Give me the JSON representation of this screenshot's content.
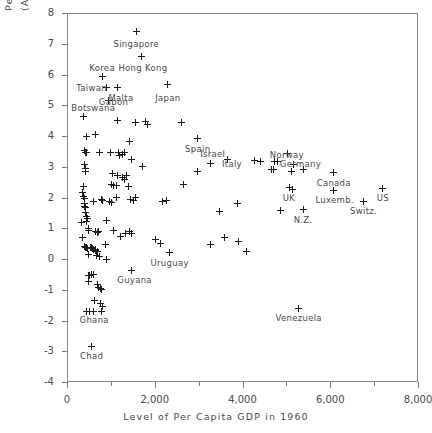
{
  "chart_data": {
    "type": "scatter",
    "title": "",
    "xlabel": "Level of Per Capita GDP in 1960",
    "ylabel_line1": "Percentage Growth Rate of Per Capita GDP",
    "ylabel_line2": "(Annual Rate, Compounded Continuously)",
    "xlim": [
      0,
      8000
    ],
    "ylim": [
      -4,
      8
    ],
    "xticks": [
      0,
      2000,
      4000,
      6000,
      8000
    ],
    "xtick_labels": [
      "0",
      "2,000",
      "4,000",
      "6,000",
      "8,000"
    ],
    "xminorticks": [
      1000,
      3000,
      5000,
      7000
    ],
    "yticks": [
      -4,
      -3,
      -2,
      -1,
      0,
      1,
      2,
      3,
      4,
      5,
      6,
      7,
      8
    ],
    "ytick_labels": [
      "-4",
      "-3",
      "-2",
      "-1",
      "0",
      "1",
      "2",
      "3",
      "4",
      "5",
      "6",
      "7",
      "8"
    ],
    "grid": false,
    "legend": false,
    "marker": "plus",
    "marker_color": "#1d1d1d",
    "frame_color": "#8a8a8a",
    "annotations": [
      {
        "label": "Singapore",
        "x": 1580,
        "y": 7.4,
        "lx": 1580,
        "ly": 7.0
      },
      {
        "label": "Hong Kong",
        "x": 1700,
        "y": 6.6,
        "lx": 1730,
        "ly": 6.22
      },
      {
        "label": "Korea",
        "x": 820,
        "y": 5.93,
        "lx": 800,
        "ly": 6.22
      },
      {
        "label": "Taiwan",
        "x": 900,
        "y": 5.58,
        "lx": 560,
        "ly": 5.55
      },
      {
        "label": "Malta",
        "x": 1140,
        "y": 5.58,
        "lx": 1230,
        "ly": 5.22
      },
      {
        "label": "Japan",
        "x": 2300,
        "y": 5.68,
        "lx": 2300,
        "ly": 5.25
      },
      {
        "label": "Gabon",
        "x": 950,
        "y": 5.14,
        "lx": 1060,
        "ly": 5.1
      },
      {
        "label": "Botswana",
        "x": 380,
        "y": 4.62,
        "lx": 600,
        "ly": 4.9
      },
      {
        "label": "Spain",
        "x": 2980,
        "y": 3.92,
        "lx": 2980,
        "ly": 3.58
      },
      {
        "label": "Israel",
        "x": 3280,
        "y": 3.12,
        "lx": 3320,
        "ly": 3.4
      },
      {
        "label": "Italy",
        "x": 3660,
        "y": 3.22,
        "lx": 3760,
        "ly": 3.08
      },
      {
        "label": "Norway",
        "x": 5020,
        "y": 3.42,
        "lx": 5010,
        "ly": 3.38
      },
      {
        "label": "Germany",
        "x": 5160,
        "y": 3.08,
        "lx": 5320,
        "ly": 3.08
      },
      {
        "label": "Canada",
        "x": 6080,
        "y": 2.8,
        "lx": 6080,
        "ly": 2.48
      },
      {
        "label": "UK",
        "x": 5080,
        "y": 2.32,
        "lx": 5060,
        "ly": 1.98
      },
      {
        "label": "Luxemb.",
        "x": 6080,
        "y": 2.22,
        "lx": 6100,
        "ly": 1.92
      },
      {
        "label": "Switz.",
        "x": 6750,
        "y": 1.88,
        "lx": 6760,
        "ly": 1.57
      },
      {
        "label": "US",
        "x": 7200,
        "y": 2.3,
        "lx": 7200,
        "ly": 1.98
      },
      {
        "label": "N.Z.",
        "x": 5380,
        "y": 1.6,
        "lx": 5380,
        "ly": 1.27
      },
      {
        "label": "Uruguay",
        "x": 2340,
        "y": 0.22,
        "lx": 2340,
        "ly": -0.13
      },
      {
        "label": "Guyana",
        "x": 1480,
        "y": -0.38,
        "lx": 1540,
        "ly": -0.68
      },
      {
        "label": "Ghana",
        "x": 520,
        "y": -1.72,
        "lx": 620,
        "ly": -1.98
      },
      {
        "label": "Venezuela",
        "x": 5280,
        "y": -1.6,
        "lx": 5280,
        "ly": -1.93
      },
      {
        "label": "Chad",
        "x": 560,
        "y": -2.86,
        "lx": 560,
        "ly": -3.17
      }
    ],
    "points": [
      [
        1580,
        7.4
      ],
      [
        1700,
        6.6
      ],
      [
        820,
        5.93
      ],
      [
        900,
        5.58
      ],
      [
        1140,
        5.58
      ],
      [
        2300,
        5.68
      ],
      [
        950,
        5.14
      ],
      [
        380,
        4.62
      ],
      [
        1140,
        4.52
      ],
      [
        1560,
        4.44
      ],
      [
        1800,
        4.48
      ],
      [
        1830,
        4.36
      ],
      [
        440,
        3.97
      ],
      [
        640,
        4.05
      ],
      [
        2980,
        3.92
      ],
      [
        400,
        3.53
      ],
      [
        420,
        3.46
      ],
      [
        440,
        3.46
      ],
      [
        750,
        3.46
      ],
      [
        1180,
        3.46
      ],
      [
        1200,
        3.38
      ],
      [
        1260,
        3.4
      ],
      [
        1300,
        3.46
      ],
      [
        1430,
        3.82
      ],
      [
        1480,
        3.24
      ],
      [
        3660,
        3.22
      ],
      [
        3280,
        3.12
      ],
      [
        410,
        3.08
      ],
      [
        420,
        2.94
      ],
      [
        430,
        2.86
      ],
      [
        1720,
        3.02
      ],
      [
        2980,
        2.84
      ],
      [
        1030,
        2.78
      ],
      [
        1140,
        2.72
      ],
      [
        1260,
        2.66
      ],
      [
        1310,
        2.6
      ],
      [
        1350,
        2.72
      ],
      [
        1400,
        2.36
      ],
      [
        1020,
        2.42
      ],
      [
        1060,
        2.4
      ],
      [
        1120,
        2.38
      ],
      [
        380,
        2.36
      ],
      [
        2660,
        2.42
      ],
      [
        5080,
        2.32
      ],
      [
        5020,
        3.42
      ],
      [
        5160,
        3.08
      ],
      [
        5120,
        2.86
      ],
      [
        5380,
        2.92
      ],
      [
        6080,
        2.8
      ],
      [
        7200,
        2.3
      ],
      [
        5150,
        2.26
      ],
      [
        6080,
        2.22
      ],
      [
        4280,
        3.2
      ],
      [
        4420,
        3.18
      ],
      [
        4720,
        3.16
      ],
      [
        4800,
        3.16
      ],
      [
        4660,
        2.9
      ],
      [
        4700,
        2.9
      ],
      [
        360,
        2.16
      ],
      [
        370,
        2.02
      ],
      [
        390,
        1.96
      ],
      [
        400,
        1.82
      ],
      [
        410,
        1.72
      ],
      [
        420,
        1.66
      ],
      [
        430,
        1.5
      ],
      [
        600,
        1.88
      ],
      [
        780,
        1.92
      ],
      [
        820,
        1.9
      ],
      [
        1130,
        2.0
      ],
      [
        1450,
        1.92
      ],
      [
        1520,
        1.9
      ],
      [
        3880,
        1.82
      ],
      [
        6750,
        1.88
      ],
      [
        5380,
        1.6
      ],
      [
        4860,
        1.58
      ],
      [
        3480,
        1.54
      ],
      [
        440,
        1.38
      ],
      [
        470,
        1.32
      ],
      [
        450,
        1.22
      ],
      [
        890,
        1.24
      ],
      [
        480,
        0.98
      ],
      [
        500,
        0.92
      ],
      [
        640,
        0.88
      ],
      [
        700,
        0.86
      ],
      [
        720,
        0.88
      ],
      [
        1060,
        0.94
      ],
      [
        1330,
        0.82
      ],
      [
        1420,
        0.88
      ],
      [
        1460,
        0.82
      ],
      [
        1220,
        0.74
      ],
      [
        3580,
        0.7
      ],
      [
        3280,
        0.46
      ],
      [
        3900,
        0.56
      ],
      [
        4080,
        0.24
      ],
      [
        410,
        0.42
      ],
      [
        430,
        0.38
      ],
      [
        450,
        0.36
      ],
      [
        460,
        0.34
      ],
      [
        530,
        0.36
      ],
      [
        550,
        0.36
      ],
      [
        580,
        0.34
      ],
      [
        600,
        0.32
      ],
      [
        640,
        0.3
      ],
      [
        660,
        0.28
      ],
      [
        700,
        0.26
      ],
      [
        880,
        0.48
      ],
      [
        500,
        0.14
      ],
      [
        680,
        0.12
      ],
      [
        740,
        0.08
      ],
      [
        900,
        0.0
      ],
      [
        2340,
        0.22
      ],
      [
        2120,
        0.5
      ],
      [
        2020,
        0.62
      ],
      [
        1480,
        -0.38
      ],
      [
        480,
        -0.54
      ],
      [
        520,
        -0.54
      ],
      [
        560,
        -0.52
      ],
      [
        600,
        -0.52
      ],
      [
        500,
        -0.72
      ],
      [
        700,
        -0.84
      ],
      [
        720,
        -0.92
      ],
      [
        760,
        -0.96
      ],
      [
        780,
        -1.0
      ],
      [
        620,
        -1.36
      ],
      [
        760,
        -1.44
      ],
      [
        440,
        -1.7
      ],
      [
        520,
        -1.72
      ],
      [
        600,
        -1.72
      ],
      [
        780,
        -1.7
      ],
      [
        820,
        -1.56
      ],
      [
        560,
        -2.86
      ],
      [
        5280,
        -1.6
      ],
      [
        350,
        0.7
      ],
      [
        1560,
        2.0
      ],
      [
        2180,
        1.88
      ],
      [
        2260,
        1.9
      ],
      [
        960,
        1.86
      ],
      [
        1010,
        1.84
      ],
      [
        340,
        1.2
      ],
      [
        1000,
        3.46
      ],
      [
        2600,
        4.44
      ]
    ]
  }
}
